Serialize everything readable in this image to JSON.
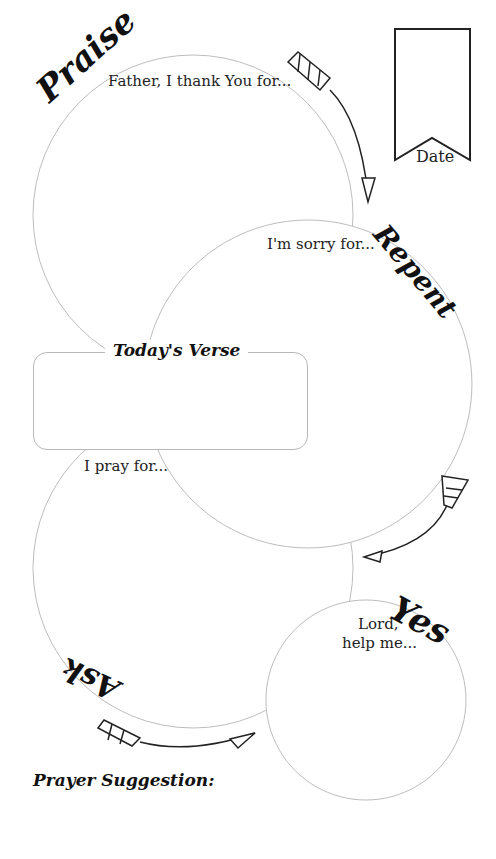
{
  "sections": {
    "praise": {
      "title": "Praise",
      "prompt": "Father, I thank You for..."
    },
    "repent": {
      "title": "Repent",
      "prompt": "I'm sorry for..."
    },
    "ask": {
      "title": "Ask",
      "prompt": "I pray for..."
    },
    "yes": {
      "title": "Yes",
      "prompt_line1": "Lord,",
      "prompt_line2": "help me..."
    }
  },
  "verse": {
    "title": "Today's Verse"
  },
  "date": {
    "label": "Date"
  },
  "prayer_suggestion": {
    "label": "Prayer Suggestion:"
  },
  "colors": {
    "circle_stroke": "#bdbdbd",
    "ink": "#111111"
  }
}
